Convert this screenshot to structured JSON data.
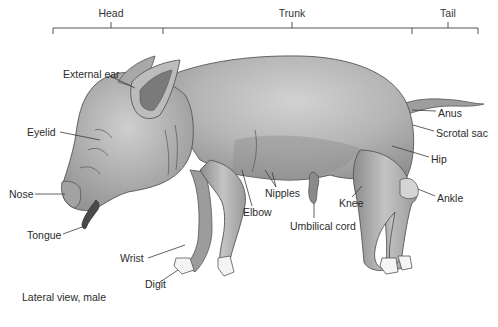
{
  "regions": [
    {
      "label": "Head",
      "x": 111
    },
    {
      "label": "Trunk",
      "x": 292
    },
    {
      "label": "Tail",
      "x": 448
    }
  ],
  "labels": [
    {
      "id": "external-ear",
      "text": "External ear",
      "x": 63,
      "y": 68
    },
    {
      "id": "eyelid",
      "text": "Eyelid",
      "x": 27,
      "y": 126
    },
    {
      "id": "nose",
      "text": "Nose",
      "x": 9,
      "y": 188
    },
    {
      "id": "tongue",
      "text": "Tongue",
      "x": 27,
      "y": 229
    },
    {
      "id": "wrist",
      "text": "Wrist",
      "x": 120,
      "y": 252
    },
    {
      "id": "digit",
      "text": "Digit",
      "x": 145,
      "y": 278
    },
    {
      "id": "elbow",
      "text": "Elbow",
      "x": 243,
      "y": 206
    },
    {
      "id": "nipples",
      "text": "Nipples",
      "x": 265,
      "y": 187
    },
    {
      "id": "umbilical-cord",
      "text": "Umbilical cord",
      "x": 290,
      "y": 220
    },
    {
      "id": "knee",
      "text": "Knee",
      "x": 339,
      "y": 197
    },
    {
      "id": "anus",
      "text": "Anus",
      "x": 438,
      "y": 107
    },
    {
      "id": "scrotal-sac",
      "text": "Scrotal sac",
      "x": 436,
      "y": 127
    },
    {
      "id": "hip",
      "text": "Hip",
      "x": 431,
      "y": 153
    },
    {
      "id": "ankle",
      "text": "Ankle",
      "x": 437,
      "y": 192
    }
  ],
  "caption": "Lateral view, male",
  "colors": {
    "line": "#444444",
    "body_light": "#c8c8c8",
    "body_mid": "#a6a6a6",
    "body_dark": "#7e7e7e",
    "tongue": "#4a4a4a",
    "hoof": "#f4f4f4"
  }
}
